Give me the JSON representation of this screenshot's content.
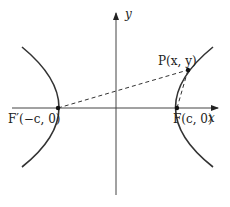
{
  "diagram": {
    "type": "hyperbola-foci",
    "axes": {
      "x_label": "x",
      "y_label": "y"
    },
    "points": {
      "P": {
        "label": "P(x, y)"
      },
      "F": {
        "label": "F(c, 0)"
      },
      "F_prime": {
        "label": "F′(−c, 0)"
      }
    },
    "colors": {
      "stroke": "#333333",
      "background": "#ffffff"
    }
  }
}
